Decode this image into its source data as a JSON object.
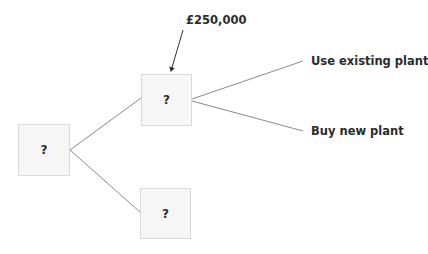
{
  "diagram": {
    "type": "decision-tree",
    "nodes": [
      {
        "id": "root",
        "label": "?"
      },
      {
        "id": "upper",
        "label": "?"
      },
      {
        "id": "lower",
        "label": "?"
      }
    ],
    "annotation": {
      "label": "£250,000",
      "target": "upper"
    },
    "branches": [
      {
        "from": "root",
        "to": "upper"
      },
      {
        "from": "root",
        "to": "lower"
      },
      {
        "from": "upper",
        "label": "Use existing plant"
      },
      {
        "from": "upper",
        "label": "Buy new plant"
      }
    ],
    "colors": {
      "node_fill": "#f6f6f6",
      "node_border": "#d9d9d9",
      "line": "#8a8a8a",
      "text": "#2b2b2b"
    }
  }
}
